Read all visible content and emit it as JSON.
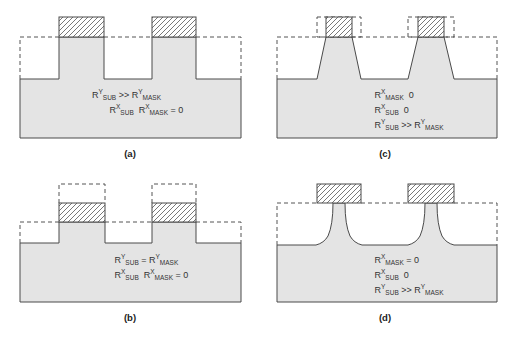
{
  "colors": {
    "substrate_fill": "#e4e4e4",
    "outline": "#4a4a4a",
    "dashed": "#555555",
    "hatch": "#555555",
    "text": "#333333"
  },
  "panels": [
    {
      "id": "a",
      "caption": "(a)",
      "equations": [
        {
          "base1": "R",
          "sup1": "Y",
          "sub1": "SUB",
          "op": " >> ",
          "base2": "R",
          "sup2": "Y",
          "sub2": "MASK",
          "tail": ""
        },
        {
          "base1": "R",
          "sup1": "X",
          "sub1": "SUB",
          "op": "  ",
          "base2": "R",
          "sup2": "X",
          "sub2": "MASK",
          "tail": " = 0"
        }
      ]
    },
    {
      "id": "c",
      "caption": "(c)",
      "equations": [
        {
          "base1": "R",
          "sup1": "X",
          "sub1": "MASK",
          "op": "",
          "base2": "",
          "sup2": "",
          "sub2": "",
          "tail": "  0"
        },
        {
          "base1": "R",
          "sup1": "X",
          "sub1": "SUB",
          "op": "",
          "base2": "",
          "sup2": "",
          "sub2": "",
          "tail": "  0"
        },
        {
          "base1": "R",
          "sup1": "Y",
          "sub1": "SUB",
          "op": " >> ",
          "base2": "R",
          "sup2": "Y",
          "sub2": "MASK",
          "tail": ""
        }
      ]
    },
    {
      "id": "b",
      "caption": "(b)",
      "equations": [
        {
          "base1": "R",
          "sup1": "Y",
          "sub1": "SUB",
          "op": " = ",
          "base2": "R",
          "sup2": "Y",
          "sub2": "MASK",
          "tail": ""
        },
        {
          "base1": "R",
          "sup1": "X",
          "sub1": "SUB",
          "op": "  ",
          "base2": "R",
          "sup2": "X",
          "sub2": "MASK",
          "tail": " = 0"
        }
      ]
    },
    {
      "id": "d",
      "caption": "(d)",
      "equations": [
        {
          "base1": "R",
          "sup1": "X",
          "sub1": "MASK",
          "op": "",
          "base2": "",
          "sup2": "",
          "sub2": "",
          "tail": " = 0"
        },
        {
          "base1": "R",
          "sup1": "X",
          "sub1": "SUB",
          "op": "",
          "base2": "",
          "sup2": "",
          "sub2": "",
          "tail": "  0"
        },
        {
          "base1": "R",
          "sup1": "Y",
          "sub1": "SUB",
          "op": " >> ",
          "base2": "R",
          "sup2": "Y",
          "sub2": "MASK",
          "tail": ""
        }
      ]
    }
  ]
}
